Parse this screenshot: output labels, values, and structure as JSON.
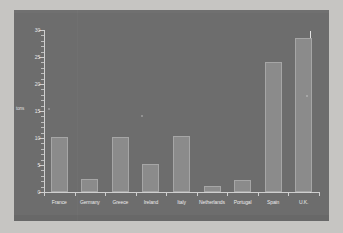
{
  "chart_data": {
    "type": "bar",
    "title": "",
    "xlabel": "",
    "ylabel": "tons",
    "categories": [
      "France",
      "Germany",
      "Greece",
      "Ireland",
      "Italy",
      "Netherlands",
      "Portugal",
      "Spain",
      "U.K."
    ],
    "values": [
      10.1,
      2.4,
      10.2,
      5.2,
      10.4,
      1.2,
      2.3,
      24.0,
      28.6
    ],
    "ylim": [
      0,
      30
    ],
    "yticks": [
      0,
      5,
      10,
      15,
      20,
      25,
      30
    ],
    "ytick_labels": [
      "0",
      "5",
      "10",
      "15",
      "20",
      "25",
      "30"
    ],
    "ytick_minor_step": 1,
    "grid": false,
    "legend": null,
    "legend_position": "none",
    "bar_color": "#8b8b8b",
    "bar_edge_color": "#a6a6a6",
    "plot_background": "#6d6d6d",
    "axis_color": "#cfcfcf",
    "text_color": "#ebebeb",
    "page_background": "#c6c5c2"
  },
  "axes": {
    "y_title": "tons"
  }
}
